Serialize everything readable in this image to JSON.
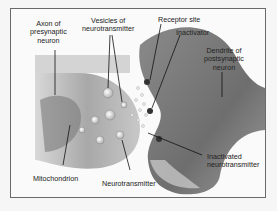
{
  "diagram": {
    "labels": {
      "axon": "Axon of\npresynaptic\nneuron",
      "vesicles": "Vesicles of\nneurotransmitter",
      "receptor_site": "Receptor site",
      "inactivator": "Inactivator",
      "dendrite": "Dendrite of\npostsynaptic\nneuron",
      "mitochondrion": "Mitochondrion",
      "neurotransmitter": "Neurotransmitter",
      "inactivated": "Inactivated\nneurotransmitter"
    },
    "ion_label": "Na+",
    "colors": {
      "frame_border": "#6a6a6a",
      "axon_fill": "#9a9a9a",
      "dendrite_fill": "#8a8a8a",
      "background": "#fafafa"
    }
  }
}
